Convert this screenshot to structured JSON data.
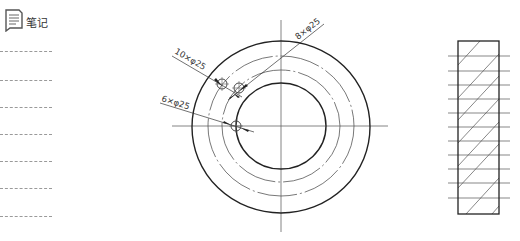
{
  "notes": {
    "title": "笔记",
    "icon": "note-icon",
    "line_count": 7
  },
  "drawing": {
    "annotations": {
      "hole_a": "10×φ25",
      "hole_b": "8×φ25",
      "hole_c": "6×φ25"
    },
    "colors": {
      "stroke": "#222222",
      "thin": "#555555",
      "center_line": "#666666"
    }
  }
}
